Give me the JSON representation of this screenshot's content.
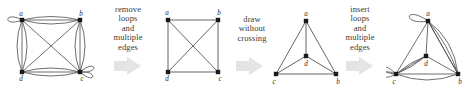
{
  "figure": {
    "background_color": "#ffffff",
    "stroke_color": "#4a4a4a",
    "vertex_color": "#1a1a1a",
    "arrow_color": "#e2e2e2",
    "text_color": "#3a3a3a"
  },
  "captions": [
    {
      "id": "caption-1",
      "lines": [
        "remove",
        "loops",
        "and",
        "multiple",
        "edges"
      ]
    },
    {
      "id": "caption-2",
      "lines": [
        "draw",
        "without",
        "crossing"
      ]
    },
    {
      "id": "caption-3",
      "lines": [
        "insert",
        "loops",
        "and",
        "multiple",
        "edges"
      ]
    }
  ],
  "arrows": [
    {
      "id": "arrow-1",
      "glyph": "right-arrow"
    },
    {
      "id": "arrow-2",
      "glyph": "right-arrow"
    },
    {
      "id": "arrow-3",
      "glyph": "right-arrow"
    }
  ],
  "panels": [
    {
      "id": "panel-1",
      "name": "multigraph-with-loops",
      "vertices": [
        {
          "id": "a",
          "label": "a",
          "x": 22,
          "y": 20,
          "label_dx": -1,
          "label_dy": -4
        },
        {
          "id": "b",
          "label": "b",
          "x": 80,
          "y": 20,
          "label_dx": 1,
          "label_dy": -4
        },
        {
          "id": "d",
          "label": "d",
          "x": 22,
          "y": 72,
          "label_dx": -1,
          "label_dy": 9
        },
        {
          "id": "c",
          "label": "c",
          "x": 80,
          "y": 72,
          "label_dx": 2,
          "label_dy": 9
        }
      ],
      "edges": [
        {
          "from": "a",
          "to": "b",
          "type": "multi",
          "count": 3
        },
        {
          "from": "d",
          "to": "c",
          "type": "multi",
          "count": 3
        },
        {
          "from": "a",
          "to": "d",
          "type": "multi",
          "count": 3
        },
        {
          "from": "b",
          "to": "c",
          "type": "multi",
          "count": 3
        },
        {
          "from": "a",
          "to": "c",
          "type": "straight",
          "count": 1
        },
        {
          "from": "b",
          "to": "d",
          "type": "straight",
          "count": 1
        }
      ],
      "loops": [
        {
          "at": "a",
          "direction": "left",
          "count": 1
        },
        {
          "at": "c",
          "direction": "right",
          "count": 2
        }
      ]
    },
    {
      "id": "panel-2",
      "name": "simple-graph-with-crossing",
      "vertices": [
        {
          "id": "a",
          "label": "a",
          "x": 16,
          "y": 20,
          "label_dx": -1,
          "label_dy": -4
        },
        {
          "id": "b",
          "label": "b",
          "x": 66,
          "y": 20,
          "label_dx": 1,
          "label_dy": -4
        },
        {
          "id": "d",
          "label": "d",
          "x": 16,
          "y": 72,
          "label_dx": -1,
          "label_dy": 9
        },
        {
          "id": "c",
          "label": "c",
          "x": 66,
          "y": 72,
          "label_dx": 2,
          "label_dy": 9
        }
      ],
      "edges": [
        {
          "from": "a",
          "to": "b",
          "type": "straight",
          "count": 1
        },
        {
          "from": "b",
          "to": "c",
          "type": "straight",
          "count": 1
        },
        {
          "from": "c",
          "to": "d",
          "type": "straight",
          "count": 1
        },
        {
          "from": "d",
          "to": "a",
          "type": "straight",
          "count": 1
        },
        {
          "from": "a",
          "to": "c",
          "type": "straight",
          "count": 1
        },
        {
          "from": "b",
          "to": "d",
          "type": "straight",
          "count": 1
        }
      ],
      "loops": []
    },
    {
      "id": "panel-3",
      "name": "planar-drawing",
      "vertices": [
        {
          "id": "a",
          "label": "a",
          "x": 38,
          "y": 21,
          "label_dx": 0,
          "label_dy": -4
        },
        {
          "id": "d",
          "label": "d",
          "x": 38,
          "y": 56,
          "label_dx": 0,
          "label_dy": 9
        },
        {
          "id": "c",
          "label": "c",
          "x": 8,
          "y": 74,
          "label_dx": -1,
          "label_dy": 9
        },
        {
          "id": "b",
          "label": "b",
          "x": 68,
          "y": 74,
          "label_dx": 2,
          "label_dy": 9
        }
      ],
      "edges": [
        {
          "from": "a",
          "to": "c",
          "type": "straight",
          "count": 1
        },
        {
          "from": "a",
          "to": "b",
          "type": "straight",
          "count": 1
        },
        {
          "from": "c",
          "to": "b",
          "type": "straight",
          "count": 1
        },
        {
          "from": "a",
          "to": "d",
          "type": "straight",
          "count": 1
        },
        {
          "from": "c",
          "to": "d",
          "type": "straight",
          "count": 1
        },
        {
          "from": "b",
          "to": "d",
          "type": "straight",
          "count": 1
        }
      ],
      "loops": []
    },
    {
      "id": "panel-4",
      "name": "planar-multigraph-with-loops",
      "vertices": [
        {
          "id": "a",
          "label": "a",
          "x": 42,
          "y": 21,
          "label_dx": 0,
          "label_dy": -4
        },
        {
          "id": "d",
          "label": "d",
          "x": 40,
          "y": 56,
          "label_dx": 0,
          "label_dy": 9
        },
        {
          "id": "c",
          "label": "c",
          "x": 10,
          "y": 74,
          "label_dx": -1,
          "label_dy": 9
        },
        {
          "id": "b",
          "label": "b",
          "x": 72,
          "y": 74,
          "label_dx": 2,
          "label_dy": 9
        }
      ],
      "edges": [
        {
          "from": "a",
          "to": "c",
          "type": "straight",
          "count": 1
        },
        {
          "from": "a",
          "to": "b",
          "type": "multi",
          "count": 4
        },
        {
          "from": "c",
          "to": "b",
          "type": "multi",
          "count": 2
        },
        {
          "from": "a",
          "to": "d",
          "type": "straight",
          "count": 1
        },
        {
          "from": "c",
          "to": "d",
          "type": "multi",
          "count": 3
        },
        {
          "from": "b",
          "to": "d",
          "type": "straight",
          "count": 1
        }
      ],
      "loops": [
        {
          "at": "a",
          "direction": "up-left",
          "count": 1
        },
        {
          "at": "c",
          "direction": "left",
          "count": 2
        }
      ]
    }
  ]
}
